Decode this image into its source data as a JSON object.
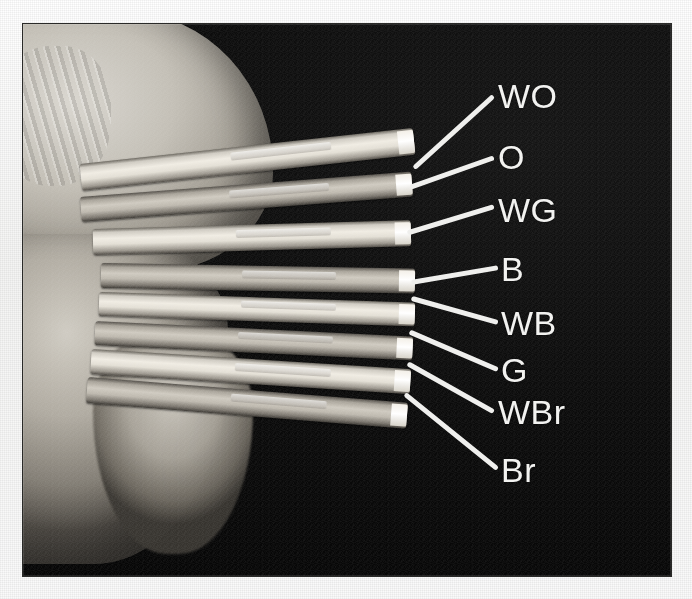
{
  "image": {
    "kind": "photograph",
    "color_mode": "grayscale",
    "subject": "hand holding an untwisted Ethernet cable with eight fanned-out conductors, each labelled",
    "background_color": "#0b0b0b",
    "page_background_color": "#f7f7f6",
    "label_color": "#f2f2f0",
    "leader_line_color": "#efefed",
    "frame": {
      "x": 22,
      "y": 23,
      "width": 650,
      "height": 554
    }
  },
  "annotations": {
    "count": 8,
    "labels": [
      {
        "id": "wo",
        "text": "WO",
        "meaning": "white-orange",
        "label_x": 497,
        "label_y": 78,
        "line_from_x": 416,
        "line_from_y": 166,
        "line_to_x": 492,
        "line_to_y": 97
      },
      {
        "id": "o",
        "text": "O",
        "meaning": "orange",
        "label_x": 497,
        "label_y": 139,
        "line_from_x": 413,
        "line_from_y": 186,
        "line_to_x": 492,
        "line_to_y": 158
      },
      {
        "id": "wg",
        "text": "WG",
        "meaning": "white-green",
        "label_x": 497,
        "label_y": 192,
        "line_from_x": 410,
        "line_from_y": 232,
        "line_to_x": 492,
        "line_to_y": 207
      },
      {
        "id": "b",
        "text": "B",
        "meaning": "blue",
        "label_x": 500,
        "label_y": 251,
        "line_from_x": 414,
        "line_from_y": 282,
        "line_to_x": 496,
        "line_to_y": 268
      },
      {
        "id": "wb",
        "text": "WB",
        "meaning": "white-blue",
        "label_x": 500,
        "label_y": 305,
        "line_from_x": 414,
        "line_from_y": 299,
        "line_to_x": 496,
        "line_to_y": 322
      },
      {
        "id": "g",
        "text": "G",
        "meaning": "green",
        "label_x": 500,
        "label_y": 352,
        "line_from_x": 412,
        "line_from_y": 333,
        "line_to_x": 496,
        "line_to_y": 369
      },
      {
        "id": "wbr",
        "text": "WBr",
        "meaning": "white-brown",
        "label_x": 497,
        "label_y": 394,
        "line_from_x": 410,
        "line_from_y": 365,
        "line_to_x": 492,
        "line_to_y": 411
      },
      {
        "id": "br",
        "text": "Br",
        "meaning": "brown",
        "label_x": 500,
        "label_y": 452,
        "line_from_x": 407,
        "line_from_y": 396,
        "line_to_x": 496,
        "line_to_y": 468
      }
    ]
  },
  "wires": [
    {
      "id": "wire-wo",
      "label": "WO",
      "x": 80,
      "y": 163,
      "width": 335,
      "height": 27,
      "angle": -6.2,
      "tone": "light"
    },
    {
      "id": "wire-o",
      "label": "O",
      "x": 80,
      "y": 196,
      "width": 332,
      "height": 25,
      "angle": -4.4,
      "tone": "dark"
    },
    {
      "id": "wire-wg",
      "label": "WG",
      "x": 92,
      "y": 228,
      "width": 318,
      "height": 26,
      "angle": -1.6,
      "tone": "light"
    },
    {
      "id": "wire-b",
      "label": "B",
      "x": 100,
      "y": 262,
      "width": 314,
      "height": 25,
      "angle": 1.0,
      "tone": "dark"
    },
    {
      "id": "wire-wb",
      "label": "WB",
      "x": 98,
      "y": 291,
      "width": 316,
      "height": 24,
      "angle": 1.9,
      "tone": "light"
    },
    {
      "id": "wire-g",
      "label": "G",
      "x": 94,
      "y": 320,
      "width": 318,
      "height": 24,
      "angle": 2.8,
      "tone": "dark"
    },
    {
      "id": "wire-wbr",
      "label": "WBr",
      "x": 90,
      "y": 348,
      "width": 320,
      "height": 25,
      "angle": 3.6,
      "tone": "light"
    },
    {
      "id": "wire-br",
      "label": "Br",
      "x": 86,
      "y": 376,
      "width": 321,
      "height": 26,
      "angle": 4.6,
      "tone": "dark"
    }
  ]
}
